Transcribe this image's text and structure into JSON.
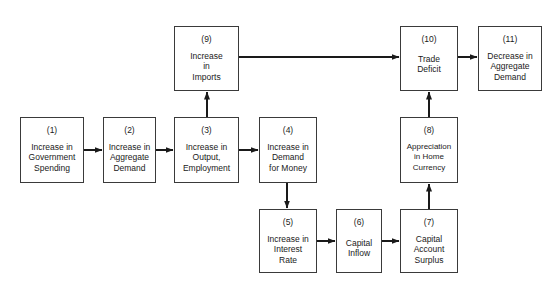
{
  "diagram": {
    "boxes": [
      {
        "id": "1",
        "num": "(1)",
        "label": "Increase in\nGovernment\nSpending",
        "x": 20,
        "y": 117,
        "w": 64,
        "h": 66
      },
      {
        "id": "2",
        "num": "(2)",
        "label": "Increase in\nAggregate\nDemand",
        "x": 103,
        "y": 117,
        "w": 53,
        "h": 66
      },
      {
        "id": "3",
        "num": "(3)",
        "label": "Increase in\nOutput,\nEmployment",
        "x": 174,
        "y": 117,
        "w": 65,
        "h": 66
      },
      {
        "id": "4",
        "num": "(4)",
        "label": "Increase in\nDemand\nfor Money",
        "x": 259,
        "y": 117,
        "w": 58,
        "h": 66
      },
      {
        "id": "5",
        "num": "(5)",
        "label": "Increase in\nInterest\nRate",
        "x": 259,
        "y": 209,
        "w": 58,
        "h": 64
      },
      {
        "id": "6",
        "num": "(6)",
        "label": "Capital\nInflow",
        "x": 336,
        "y": 209,
        "w": 46,
        "h": 64
      },
      {
        "id": "7",
        "num": "(7)",
        "label": "Capital\nAccount\nSurplus",
        "x": 400,
        "y": 209,
        "w": 58,
        "h": 64
      },
      {
        "id": "8",
        "num": "(8)",
        "label": "Appreciation\nin Home\nCurrency",
        "x": 400,
        "y": 117,
        "w": 58,
        "h": 66
      },
      {
        "id": "9",
        "num": "(9)",
        "label": "Increase\nin\nImports",
        "x": 174,
        "y": 26,
        "w": 65,
        "h": 65
      },
      {
        "id": "10",
        "num": "(10)",
        "label": "Trade\nDeficit",
        "x": 400,
        "y": 26,
        "w": 58,
        "h": 65
      },
      {
        "id": "11",
        "num": "(11)",
        "label": "Decrease in\nAggregate\nDemand",
        "x": 478,
        "y": 26,
        "w": 64,
        "h": 65
      }
    ],
    "arrows": [
      {
        "from": "1",
        "to": "2"
      },
      {
        "from": "2",
        "to": "3"
      },
      {
        "from": "3",
        "to": "4"
      },
      {
        "from": "3",
        "to": "9"
      },
      {
        "from": "4",
        "to": "5"
      },
      {
        "from": "5",
        "to": "6"
      },
      {
        "from": "6",
        "to": "7"
      },
      {
        "from": "7",
        "to": "8"
      },
      {
        "from": "8",
        "to": "10"
      },
      {
        "from": "9",
        "to": "10"
      },
      {
        "from": "10",
        "to": "11"
      }
    ],
    "colors": {
      "line": "#1a1a1a",
      "border": "#3a3a3a",
      "background": "#ffffff"
    }
  }
}
